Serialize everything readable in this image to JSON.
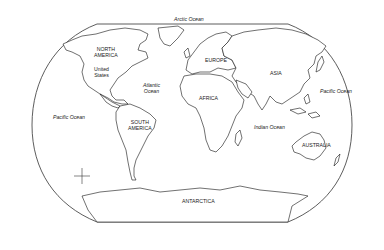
{
  "map": {
    "type": "world outline map",
    "projection": "Robinson-like",
    "colors": {
      "land_fill": "#ffffff",
      "coastline": "#111111",
      "background": "#ffffff"
    },
    "continents": [
      {
        "id": "north-america",
        "label_line1": "NORTH",
        "label_line2": "AMERICA"
      },
      {
        "id": "south-america",
        "label_line1": "SOUTH",
        "label_line2": "AMERICA"
      },
      {
        "id": "europe",
        "label": "EUROPE"
      },
      {
        "id": "africa",
        "label": "AFRICA"
      },
      {
        "id": "asia",
        "label": "ASIA"
      },
      {
        "id": "australia",
        "label": "AUSTRALIA"
      },
      {
        "id": "antarctica",
        "label": "ANTARCTICA"
      }
    ],
    "countries": [
      {
        "id": "united-states",
        "label_line1": "United",
        "label_line2": "States"
      }
    ],
    "oceans": [
      {
        "id": "arctic",
        "label": "Arctic Ocean"
      },
      {
        "id": "atlantic",
        "label_line1": "Atlantic",
        "label_line2": "Ocean"
      },
      {
        "id": "pacific-west",
        "label": "Pacific Ocean"
      },
      {
        "id": "pacific-east",
        "label": "Pacific Ocean"
      },
      {
        "id": "indian",
        "label": "Indian Ocean"
      }
    ],
    "compass": {
      "n": "N",
      "s": "S",
      "e": "E",
      "w": "W"
    }
  }
}
